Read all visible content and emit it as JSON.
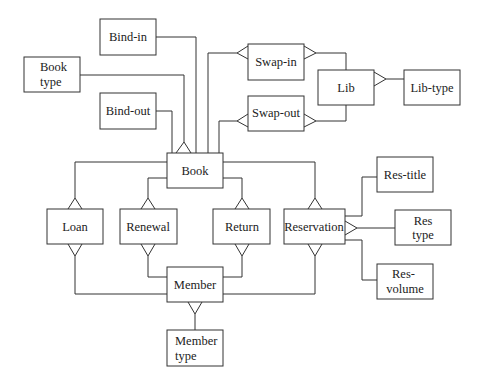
{
  "diagram": {
    "type": "entity-relationship",
    "entities": [
      {
        "id": "bind_in",
        "lines": [
          "Bind-in"
        ]
      },
      {
        "id": "book_type",
        "lines": [
          "Book",
          "type"
        ]
      },
      {
        "id": "bind_out",
        "lines": [
          "Bind-out"
        ]
      },
      {
        "id": "swap_in",
        "lines": [
          "Swap-in"
        ]
      },
      {
        "id": "swap_out",
        "lines": [
          "Swap-out"
        ]
      },
      {
        "id": "lib",
        "lines": [
          "Lib"
        ]
      },
      {
        "id": "lib_type",
        "lines": [
          "Lib-type"
        ]
      },
      {
        "id": "book",
        "lines": [
          "Book"
        ]
      },
      {
        "id": "loan",
        "lines": [
          "Loan"
        ]
      },
      {
        "id": "renewal",
        "lines": [
          "Renewal"
        ]
      },
      {
        "id": "return",
        "lines": [
          "Return"
        ]
      },
      {
        "id": "reservation",
        "lines": [
          "Reservation"
        ]
      },
      {
        "id": "res_title",
        "lines": [
          "Res-title"
        ]
      },
      {
        "id": "res_type",
        "lines": [
          "Res",
          "type"
        ]
      },
      {
        "id": "res_volume",
        "lines": [
          "Res-",
          "volume"
        ]
      },
      {
        "id": "member",
        "lines": [
          "Member"
        ]
      },
      {
        "id": "member_type",
        "lines": [
          "Member",
          "type"
        ]
      }
    ],
    "relationships": [
      {
        "one": "Bind-in",
        "many": "Book"
      },
      {
        "one": "Book type",
        "many": "Book"
      },
      {
        "one": "Bind-out",
        "many": "Book"
      },
      {
        "one": "Book",
        "many": "Swap-in"
      },
      {
        "one": "Book",
        "many": "Swap-out"
      },
      {
        "one": "Lib",
        "many": "Swap-in"
      },
      {
        "one": "Lib",
        "many": "Swap-out"
      },
      {
        "one": "Lib-type",
        "many": "Lib"
      },
      {
        "one": "Book",
        "many": "Loan"
      },
      {
        "one": "Book",
        "many": "Renewal"
      },
      {
        "one": "Book",
        "many": "Return"
      },
      {
        "one": "Book",
        "many": "Reservation"
      },
      {
        "one": "Member",
        "many": "Loan"
      },
      {
        "one": "Member",
        "many": "Renewal"
      },
      {
        "one": "Member",
        "many": "Return"
      },
      {
        "one": "Member",
        "many": "Reservation"
      },
      {
        "one": "Res-title",
        "many": "Reservation"
      },
      {
        "one": "Res type",
        "many": "Reservation"
      },
      {
        "one": "Res-volume",
        "many": "Reservation"
      },
      {
        "one": "Member type",
        "many": "Member"
      }
    ]
  }
}
